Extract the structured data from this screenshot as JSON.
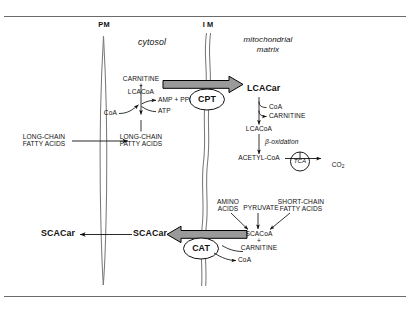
{
  "figure": {
    "frame_color": "#6b6b6b",
    "background": "#ffffff",
    "ink": "#111111",
    "arrow_fill": "#9a9a9a",
    "arrow_stroke": "#000000",
    "membrane_color": "#7a7a7a"
  },
  "membranes": {
    "plasma_membrane_label": "PM",
    "inner_membrane_label": "I M"
  },
  "compartments": {
    "cytosol": "cytosol",
    "matrix_line1": "mitochondrial",
    "matrix_line2": "matrix"
  },
  "enzymes": {
    "cpt": "CPT",
    "cat": "CAT",
    "tca": "TCA"
  },
  "upper_pathway": {
    "substrate_line1": "CARNITINE",
    "substrate_plus": "+",
    "substrate_line2": "LCACoA",
    "cofactor_in": "CoA",
    "product_out": "AMP + PPi",
    "cosubstrate": "ATP",
    "extracellular_fa_line1": "LONG-CHAIN",
    "extracellular_fa_line2": "FATTY ACIDS",
    "cytosolic_fa_line1": "LONG-CHAIN",
    "cytosolic_fa_line2": "FATTY ACIDS"
  },
  "matrix_pathway": {
    "lcacar": "LCACar",
    "released_coa": "CoA",
    "released_carnitine": "CARNITINE",
    "lcacoa": "LCACoA",
    "beta_oxidation": "β-oxidation",
    "acetyl_coa": "ACETYL-CoA",
    "co2": "CO",
    "co2_sub": "2"
  },
  "lower_pathway": {
    "amino_acids_line1": "AMINO",
    "amino_acids_line2": "ACIDS",
    "pyruvate": "PYRUVATE",
    "scfa_line1": "SHORT-CHAIN",
    "scfa_line2": "FATTY ACIDS",
    "scacoa": "SCACoA",
    "plus": "+",
    "carnitine": "CARNITINE",
    "released_coa": "CoA",
    "scacar_cytosol": "SCACar",
    "scacar_extracellular": "SCACar"
  }
}
